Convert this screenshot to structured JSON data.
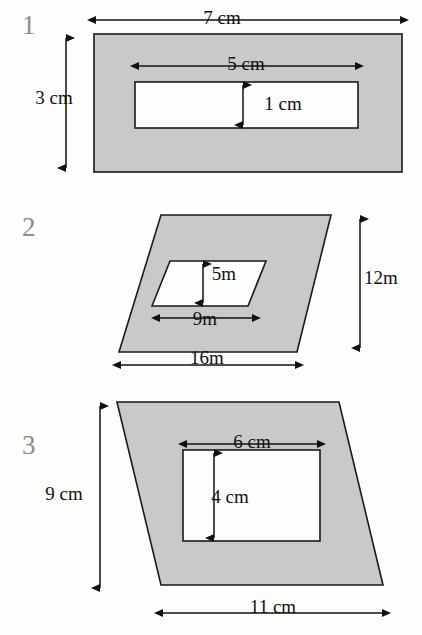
{
  "page": {
    "background_color": "#fdfdfc",
    "shade_color": "#c9c9c9",
    "stroke_color": "#1a1a1a",
    "number_color": "#8c8c8c"
  },
  "figures": [
    {
      "number": "1",
      "outer_shape": "rectangle",
      "inner_shape": "rectangle",
      "labels": {
        "outer_width": "7 cm",
        "outer_height": "3 cm",
        "inner_width": "5 cm",
        "inner_height": "1 cm"
      }
    },
    {
      "number": "2",
      "outer_shape": "parallelogram",
      "inner_shape": "parallelogram",
      "labels": {
        "outer_base": "16m",
        "outer_height": "12m",
        "inner_base": "9m",
        "inner_height": "5m"
      }
    },
    {
      "number": "3",
      "outer_shape": "parallelogram",
      "inner_shape": "rectangle",
      "labels": {
        "outer_base": "11 cm",
        "outer_height": "9 cm",
        "inner_width": "6 cm",
        "inner_height": "4 cm"
      }
    }
  ]
}
